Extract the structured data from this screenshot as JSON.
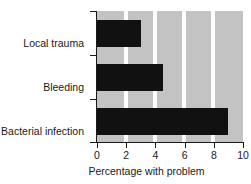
{
  "chart_data": {
    "type": "bar",
    "orientation": "horizontal",
    "title": "",
    "xlabel": "Percentage with problem",
    "ylabel": "",
    "categories": [
      "Local trauma",
      "Bleeding",
      "Bacterial infection"
    ],
    "values": [
      3.0,
      4.5,
      9.0
    ],
    "xlim": [
      0,
      10
    ],
    "xticks": [
      "0",
      "2",
      "4",
      "6",
      "8",
      "10"
    ],
    "xtick_values": [
      0,
      2,
      4,
      6,
      8,
      10
    ],
    "grid": true,
    "legend": false,
    "colors": {
      "bar": "#111111",
      "plot_background": "#c3c3c3",
      "gridline": "#ffffff",
      "axis": "#1a1a1a",
      "text": "#1a1a1a",
      "page_background": "#ffffff"
    }
  }
}
